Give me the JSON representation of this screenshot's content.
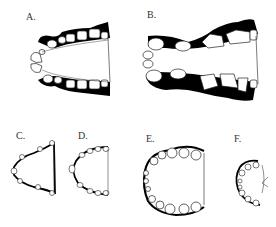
{
  "figure": {
    "panels": [
      {
        "id": "A",
        "label": "A.",
        "description": "upper dental arch, elongated U-shape, dark shading on buccal side"
      },
      {
        "id": "B",
        "label": "B.",
        "description": "upper dental arch, large elongated, heavy dark shading"
      },
      {
        "id": "C",
        "label": "C.",
        "description": "small V-shaped dental arch"
      },
      {
        "id": "D",
        "label": "D.",
        "description": "small U-shaped dental arch"
      },
      {
        "id": "E",
        "label": "E.",
        "description": "large rounded dental arch"
      },
      {
        "id": "F",
        "label": "F.",
        "description": "small rounded dental arch"
      }
    ],
    "colors": {
      "ink": "#000000",
      "outline": "#222222",
      "background": "#ffffff"
    }
  }
}
